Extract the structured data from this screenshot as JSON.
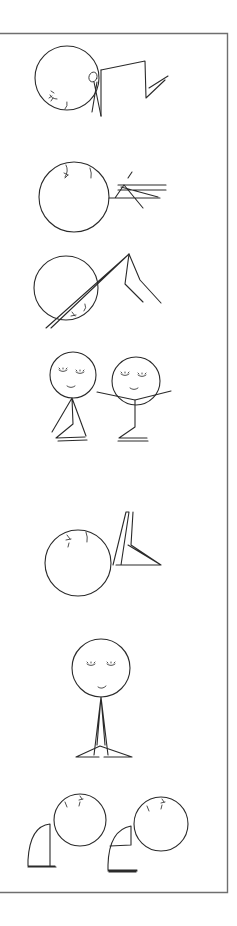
{
  "illustration": {
    "subject": "Stick-figure yoga pose sequence",
    "frame": {
      "stroke": "#6f6f6f"
    },
    "ink_color": "#2a2a2a",
    "figures": [
      {
        "id": "pose-1",
        "label": "Forward-folded figure with bent legs"
      },
      {
        "id": "pose-2",
        "label": "Round figure with stacked limb lines"
      },
      {
        "id": "pose-3",
        "label": "Figure with diagonal body line and bent leg"
      },
      {
        "id": "pose-4a",
        "label": "Seated figure, eyes closed, smiling"
      },
      {
        "id": "pose-4b",
        "label": "Seated figure with arms outstretched"
      },
      {
        "id": "pose-5",
        "label": "Round figure with raised legs"
      },
      {
        "id": "pose-6",
        "label": "Standing figure with crossed legs, smiling"
      },
      {
        "id": "pose-7a",
        "label": "Curled figure, left"
      },
      {
        "id": "pose-7b",
        "label": "Curled figure, right"
      }
    ]
  }
}
